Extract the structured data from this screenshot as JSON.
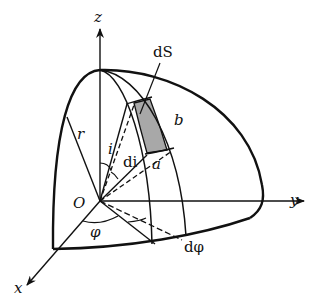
{
  "diagram": {
    "type": "spherical-coordinate-surface-element",
    "axes": {
      "z": "z",
      "y": "y",
      "x": "x"
    },
    "origin_label": "O",
    "labels": {
      "surface_element": "dS",
      "radius": "r",
      "polar_angle": "i",
      "polar_increment": "di",
      "azimuth_angle": "φ",
      "azimuth_increment": "dφ",
      "patch_side_b": "b",
      "patch_side_a": "a"
    },
    "colors": {
      "stroke": "#111111",
      "shaded_patch": "#a8a8a8",
      "background": "#ffffff"
    }
  }
}
